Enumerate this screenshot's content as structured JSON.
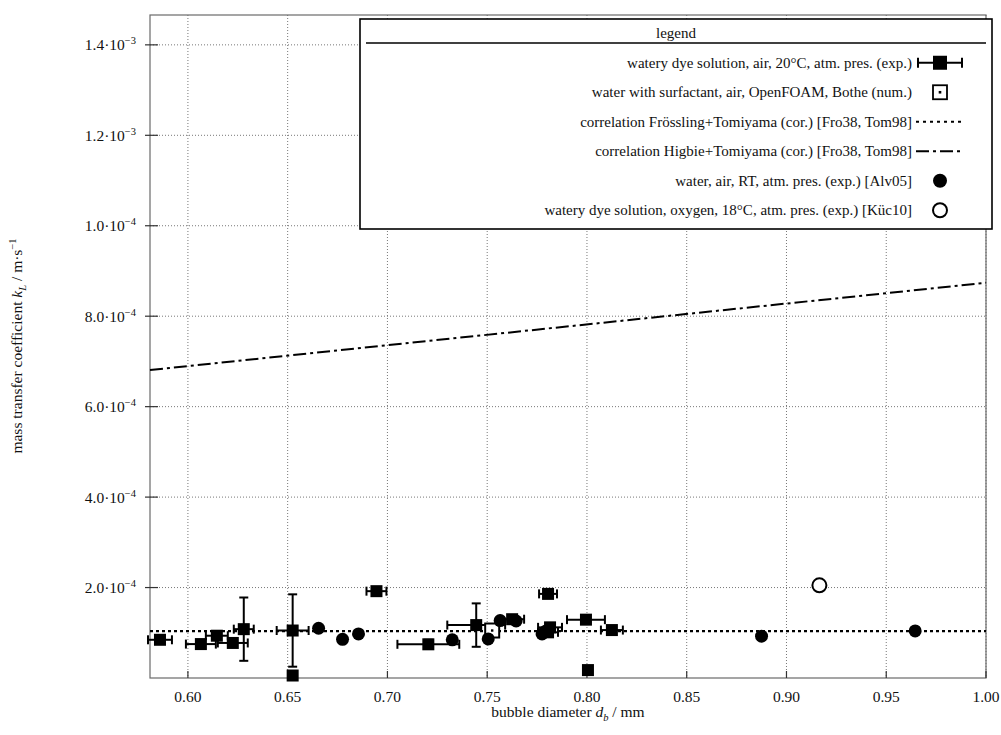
{
  "chart_data": {
    "type": "scatter",
    "title": "",
    "xlabel": "bubble diameter d_b / mm",
    "ylabel": "mass transfer coefficient k_L / m·s⁻¹",
    "xlim": [
      0.581,
      1.0
    ],
    "ylim": [
      0.0,
      0.001466
    ],
    "grid": true,
    "xticks": [
      0.6,
      0.65,
      0.7,
      0.75,
      0.8,
      0.85,
      0.9,
      0.95,
      1.0
    ],
    "xtick_labels": [
      "0.60",
      "0.65",
      "0.70",
      "0.75",
      "0.80",
      "0.85",
      "0.90",
      "0.95",
      "1.00"
    ],
    "yticks": [
      0.0002,
      0.0004,
      0.0006,
      0.0008,
      0.001,
      0.0012,
      0.0014
    ],
    "ytick_labels": [
      {
        "mant": "2.0",
        "exp": "−4"
      },
      {
        "mant": "4.0",
        "exp": "−4"
      },
      {
        "mant": "6.0",
        "exp": "−4"
      },
      {
        "mant": "8.0",
        "exp": "−4"
      },
      {
        "mant": "1.0",
        "exp": "−4"
      },
      {
        "mant": "1.2",
        "exp": "−3"
      },
      {
        "mant": "1.4",
        "exp": "−3"
      }
    ],
    "legend_position": "top-right",
    "legend_title": "legend",
    "series": [
      {
        "name": "watery dye solution, air, 20°C, atm. pres. (exp.)",
        "marker": "filled-square-errorbar",
        "points": [
          {
            "x": 0.586,
            "y": 8.45e-05,
            "xerr": 0.006,
            "yerr": 0.0
          },
          {
            "x": 0.6065,
            "y": 7.5e-05,
            "xerr": 0.0075,
            "yerr": 0.0
          },
          {
            "x": 0.6145,
            "y": 9.35e-05,
            "xerr": 0.0055,
            "yerr": 0.0
          },
          {
            "x": 0.6225,
            "y": 7.75e-05,
            "xerr": 0.0075,
            "yerr": 0.0
          },
          {
            "x": 0.628,
            "y": 0.000108,
            "xerr": 0.005,
            "yerr": 7e-05
          },
          {
            "x": 0.6525,
            "y": 0.000105,
            "xerr": 0.008,
            "yerr": 8e-05
          },
          {
            "x": 0.6525,
            "y": 5.5e-06,
            "xerr": 0.0,
            "yerr": 0.0
          },
          {
            "x": 0.6945,
            "y": 0.000192,
            "xerr": 0.005,
            "yerr": 0.0
          },
          {
            "x": 0.7205,
            "y": 7.45e-05,
            "xerr": 0.0155,
            "yerr": 1e-05
          },
          {
            "x": 0.7445,
            "y": 0.000117,
            "xerr": 0.0145,
            "yerr": 4.8e-05
          },
          {
            "x": 0.7625,
            "y": 0.00013,
            "xerr": 0.006,
            "yerr": 0.0
          },
          {
            "x": 0.7805,
            "y": 0.000186,
            "xerr": 0.0045,
            "yerr": 0.0
          },
          {
            "x": 0.7815,
            "y": 0.000112,
            "xerr": 0.006,
            "yerr": 0.0
          },
          {
            "x": 0.7805,
            "y": 0.000101,
            "xerr": 0.005,
            "yerr": 0.0
          },
          {
            "x": 0.7995,
            "y": 0.000129,
            "xerr": 0.0095,
            "yerr": 0.0
          },
          {
            "x": 0.8005,
            "y": 1.75e-05,
            "xerr": 0.0,
            "yerr": 0.0
          },
          {
            "x": 0.8125,
            "y": 0.000106,
            "xerr": 0.0055,
            "yerr": 0.0
          }
        ]
      },
      {
        "name": "water with surfactant, air, OpenFOAM, Bothe (num.)",
        "marker": "open-square-dot",
        "points": [
          {
            "x": 0.7525,
            "y": 0.000105
          }
        ]
      },
      {
        "name": "water, air, RT, atm. pres. (exp.) [Alv05]",
        "marker": "filled-circle",
        "points": [
          {
            "x": 0.6655,
            "y": 0.00011
          },
          {
            "x": 0.6775,
            "y": 8.55e-05
          },
          {
            "x": 0.6855,
            "y": 9.75e-05
          },
          {
            "x": 0.7325,
            "y": 8.45e-05
          },
          {
            "x": 0.7505,
            "y": 8.65e-05
          },
          {
            "x": 0.7565,
            "y": 0.000127
          },
          {
            "x": 0.7645,
            "y": 0.000126
          },
          {
            "x": 0.7775,
            "y": 9.75e-05
          },
          {
            "x": 0.7795,
            "y": 0.000104
          },
          {
            "x": 0.8875,
            "y": 9.25e-05
          },
          {
            "x": 0.9645,
            "y": 0.000104
          }
        ]
      },
      {
        "name": "watery dye solution, oxygen, 18°C, atm. pres. (exp.) [Küc10]",
        "marker": "open-circle",
        "points": [
          {
            "x": 0.9165,
            "y": 0.000205
          }
        ]
      },
      {
        "name": "correlation Frössling+Tomiyama (cor.) [Fro38, Tom98]",
        "marker": "dotted-line",
        "line": [
          {
            "x": 0.581,
            "y": 0.0001035
          },
          {
            "x": 1.0,
            "y": 0.0001035
          }
        ]
      },
      {
        "name": "correlation Higbie+Tomiyama (cor.) [Fro38, Tom98]",
        "marker": "dash-dot-line",
        "line": [
          {
            "x": 0.581,
            "y": 0.000681
          },
          {
            "x": 1.0,
            "y": 0.000874
          }
        ]
      }
    ]
  },
  "axes": {
    "x_title_prefix": "bubble diameter ",
    "x_title_var": "d",
    "x_title_sub": "b",
    "x_title_suffix": " / mm",
    "y_title_prefix": "mass transfer coefficient ",
    "y_title_var": "k",
    "y_title_sub": "L",
    "y_title_suffix": " / m·s",
    "y_title_sup": "−1"
  },
  "legend": {
    "title": "legend",
    "entries": [
      {
        "label": "watery dye solution, air, 20°C, atm. pres. (exp.)",
        "symbol": "filled-square-errorbar-icon"
      },
      {
        "label": "water with surfactant, air, OpenFOAM, Bothe (num.)",
        "symbol": "open-square-dot-icon"
      },
      {
        "label": "correlation Frössling+Tomiyama (cor.) [Fro38, Tom98]",
        "symbol": "dotted-line-icon"
      },
      {
        "label": "correlation Higbie+Tomiyama (cor.) [Fro38, Tom98]",
        "symbol": "dash-dot-line-icon"
      },
      {
        "label": "water, air, RT, atm. pres. (exp.) [Alv05]",
        "symbol": "filled-circle-icon"
      },
      {
        "label": "watery dye solution, oxygen, 18°C, atm. pres. (exp.) [Küc10]",
        "symbol": "open-circle-icon"
      }
    ]
  },
  "colors": {
    "foreground": "#000000",
    "background": "#ffffff",
    "grid": "#777777",
    "frame": "#555555"
  }
}
